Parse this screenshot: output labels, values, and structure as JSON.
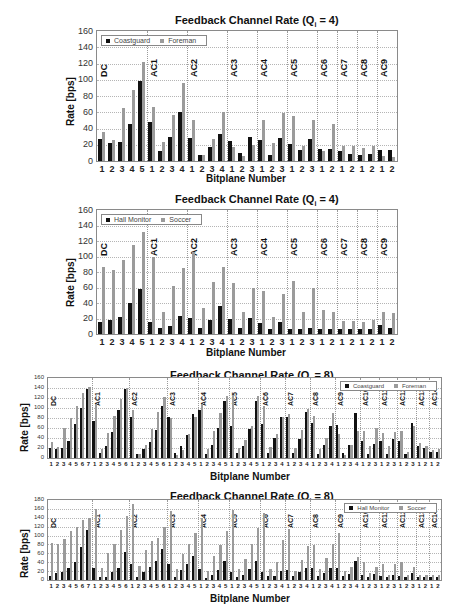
{
  "chart_data": [
    {
      "type": "bar",
      "title": "Feedback Channel Rate (Q_i = 4)",
      "title_main": "Feedback Channel Rate (Q",
      "title_sub": "i",
      "title_tail": " = 4)",
      "xlabel": "Bitplane Number",
      "ylabel": "Rate [bps]",
      "ylim": [
        0,
        160
      ],
      "yticks": [
        0,
        20,
        40,
        60,
        80,
        100,
        120,
        140,
        160
      ],
      "grid": true,
      "legend_position": "top-left",
      "legend": [
        "Coastguard",
        "Foreman"
      ],
      "groups": [
        {
          "label": "DC",
          "bitplanes": [
            1,
            2,
            3,
            4,
            5
          ]
        },
        {
          "label": "AC1",
          "bitplanes": [
            1,
            2,
            3,
            4
          ]
        },
        {
          "label": "AC2",
          "bitplanes": [
            1,
            2,
            3,
            4
          ]
        },
        {
          "label": "AC3",
          "bitplanes": [
            1,
            2,
            3
          ]
        },
        {
          "label": "AC4",
          "bitplanes": [
            1,
            2,
            3
          ]
        },
        {
          "label": "AC5",
          "bitplanes": [
            1,
            2,
            3
          ]
        },
        {
          "label": "AC6",
          "bitplanes": [
            1,
            2
          ]
        },
        {
          "label": "AC7",
          "bitplanes": [
            1,
            2
          ]
        },
        {
          "label": "AC8",
          "bitplanes": [
            1,
            2
          ]
        },
        {
          "label": "AC9",
          "bitplanes": [
            1,
            2
          ]
        }
      ],
      "categories": [
        "1",
        "2",
        "3",
        "4",
        "5",
        "1",
        "2",
        "3",
        "4",
        "1",
        "2",
        "3",
        "4",
        "1",
        "2",
        "3",
        "1",
        "2",
        "3",
        "1",
        "2",
        "3",
        "1",
        "2",
        "1",
        "2",
        "1",
        "2",
        "1",
        "2"
      ],
      "series": [
        {
          "name": "Coastguard",
          "color": "#111111",
          "values": [
            27,
            22,
            24,
            46,
            98,
            48,
            12,
            29,
            60,
            28,
            7,
            17,
            33,
            25,
            10,
            29,
            26,
            7,
            28,
            21,
            14,
            27,
            15,
            15,
            12,
            9,
            8,
            9,
            13,
            14
          ]
        },
        {
          "name": "Foreman",
          "color": "#9b9b9b",
          "values": [
            36,
            26,
            65,
            88,
            122,
            67,
            23,
            57,
            96,
            50,
            8,
            27,
            60,
            17,
            6,
            20,
            51,
            22,
            59,
            56,
            19,
            50,
            12,
            46,
            19,
            19,
            16,
            18,
            6,
            5
          ]
        }
      ]
    },
    {
      "type": "bar",
      "title": "Feedback Channel Rate (Q_i = 4)",
      "title_main": "Feedback Channel Rate (Q",
      "title_sub": "i",
      "title_tail": " = 4)",
      "xlabel": "Bitplane Number",
      "ylabel": "Rate [bps]",
      "ylim": [
        0,
        160
      ],
      "yticks": [
        0,
        20,
        40,
        60,
        80,
        100,
        120,
        140,
        160
      ],
      "grid": true,
      "legend_position": "top-left",
      "legend": [
        "Hall Monitor",
        "Soccer"
      ],
      "groups": [
        {
          "label": "DC",
          "bitplanes": [
            1,
            2,
            3,
            4,
            5
          ]
        },
        {
          "label": "AC1",
          "bitplanes": [
            1,
            2,
            3,
            4
          ]
        },
        {
          "label": "AC2",
          "bitplanes": [
            1,
            2,
            3,
            4
          ]
        },
        {
          "label": "AC3",
          "bitplanes": [
            1,
            2,
            3
          ]
        },
        {
          "label": "AC4",
          "bitplanes": [
            1,
            2,
            3
          ]
        },
        {
          "label": "AC5",
          "bitplanes": [
            1,
            2,
            3
          ]
        },
        {
          "label": "AC6",
          "bitplanes": [
            1,
            2
          ]
        },
        {
          "label": "AC7",
          "bitplanes": [
            1,
            2
          ]
        },
        {
          "label": "AC8",
          "bitplanes": [
            1,
            2
          ]
        },
        {
          "label": "AC9",
          "bitplanes": [
            1,
            2
          ]
        }
      ],
      "categories": [
        "1",
        "2",
        "3",
        "4",
        "5",
        "1",
        "2",
        "3",
        "4",
        "1",
        "2",
        "3",
        "4",
        "1",
        "2",
        "3",
        "1",
        "2",
        "3",
        "1",
        "2",
        "3",
        "1",
        "2",
        "1",
        "2",
        "1",
        "2",
        "1",
        "2"
      ],
      "series": [
        {
          "name": "Hall Monitor",
          "color": "#111111",
          "values": [
            15,
            18,
            22,
            40,
            58,
            15,
            8,
            10,
            23,
            21,
            8,
            18,
            36,
            20,
            8,
            21,
            14,
            7,
            15,
            7,
            7,
            8,
            7,
            7,
            6,
            6,
            6,
            6,
            11,
            8
          ]
        },
        {
          "name": "Soccer",
          "color": "#9b9b9b",
          "values": [
            86,
            82,
            95,
            115,
            132,
            99,
            28,
            62,
            85,
            106,
            34,
            67,
            86,
            66,
            29,
            60,
            56,
            22,
            51,
            68,
            29,
            60,
            31,
            28,
            17,
            17,
            15,
            18,
            28,
            27
          ]
        }
      ]
    },
    {
      "type": "bar",
      "title": "Feedback Channel Rate (Q_i = 8)",
      "title_main": "Feedback Channel Rate (Q",
      "title_sub": "i",
      "title_tail": " = 8)",
      "xlabel": "Bitplane Number",
      "ylabel": "Rate [bps]",
      "ylim": [
        0,
        160
      ],
      "yticks": [
        0,
        20,
        40,
        60,
        80,
        100,
        120,
        140,
        160
      ],
      "grid": true,
      "legend_position": "top-right",
      "legend": [
        "Coastguard",
        "Foreman"
      ],
      "groups": [
        {
          "label": "DC",
          "bitplanes": [
            1,
            2,
            3,
            4,
            5,
            6,
            7
          ]
        },
        {
          "label": "AC1",
          "bitplanes": [
            1,
            2,
            3,
            4,
            5,
            6
          ]
        },
        {
          "label": "AC2",
          "bitplanes": [
            1,
            2,
            3,
            4,
            5,
            6
          ]
        },
        {
          "label": "AC3",
          "bitplanes": [
            1,
            2,
            3,
            4,
            5
          ]
        },
        {
          "label": "AC4",
          "bitplanes": [
            1,
            2,
            3,
            4,
            5
          ]
        },
        {
          "label": "AC5",
          "bitplanes": [
            1,
            2,
            3,
            4,
            5
          ]
        },
        {
          "label": "AC6",
          "bitplanes": [
            1,
            2,
            3,
            4
          ]
        },
        {
          "label": "AC7",
          "bitplanes": [
            1,
            2,
            3,
            4
          ]
        },
        {
          "label": "AC8",
          "bitplanes": [
            1,
            2,
            3,
            4
          ]
        },
        {
          "label": "AC9",
          "bitplanes": [
            1,
            2,
            3,
            4
          ]
        },
        {
          "label": "AC10",
          "bitplanes": [
            1,
            2,
            3
          ]
        },
        {
          "label": "AC11",
          "bitplanes": [
            1,
            2,
            3
          ]
        },
        {
          "label": "AC12",
          "bitplanes": [
            1,
            2,
            3
          ]
        },
        {
          "label": "AC13",
          "bitplanes": [
            1,
            2
          ]
        },
        {
          "label": "AC14",
          "bitplanes": [
            1,
            2
          ]
        }
      ],
      "categories": [
        "1",
        "2",
        "3",
        "4",
        "5",
        "6",
        "7",
        "1",
        "2",
        "3",
        "4",
        "5",
        "6",
        "1",
        "2",
        "3",
        "4",
        "5",
        "6",
        "1",
        "2",
        "3",
        "4",
        "5",
        "1",
        "2",
        "3",
        "4",
        "5",
        "1",
        "2",
        "3",
        "4",
        "5",
        "1",
        "2",
        "3",
        "4",
        "1",
        "2",
        "3",
        "4",
        "1",
        "2",
        "3",
        "4",
        "1",
        "2",
        "3",
        "4",
        "1",
        "2",
        "3",
        "1",
        "2",
        "3",
        "1",
        "2",
        "3",
        "1",
        "2",
        "1",
        "2"
      ],
      "series": [
        {
          "name": "Coastguard",
          "color": "#111111",
          "values": [
            21,
            18,
            21,
            35,
            69,
            100,
            138,
            74,
            11,
            25,
            52,
            97,
            138,
            82,
            8,
            19,
            33,
            57,
            104,
            83,
            10,
            24,
            46,
            89,
            97,
            8,
            26,
            61,
            115,
            65,
            10,
            25,
            59,
            115,
            69,
            10,
            40,
            83,
            82,
            10,
            38,
            92,
            71,
            9,
            26,
            64,
            67,
            10,
            26,
            90,
            34,
            8,
            28,
            34,
            8,
            38,
            34,
            9,
            70,
            25,
            20,
            13,
            12
          ]
        },
        {
          "name": "Foreman",
          "color": "#9b9b9b",
          "values": [
            33,
            22,
            60,
            80,
            105,
            131,
            143,
            109,
            19,
            51,
            85,
            119,
            141,
            96,
            8,
            26,
            59,
            93,
            123,
            80,
            6,
            16,
            48,
            83,
            108,
            18,
            54,
            90,
            124,
            126,
            20,
            37,
            65,
            125,
            105,
            22,
            48,
            83,
            88,
            20,
            56,
            98,
            84,
            19,
            40,
            90,
            48,
            6,
            27,
            54,
            54,
            25,
            60,
            50,
            25,
            52,
            54,
            12,
            64,
            30,
            25,
            17,
            18
          ]
        }
      ]
    },
    {
      "type": "bar",
      "title": "Feedback Channel Rate (Q_i = 8)",
      "title_main": "Feedback Channel Rate (Q",
      "title_sub": "i",
      "title_tail": " = 8)",
      "xlabel": "Bitplane Number",
      "ylabel": "Rate [bps]",
      "ylim": [
        0,
        180
      ],
      "yticks": [
        0,
        20,
        40,
        60,
        80,
        100,
        120,
        140,
        160,
        180
      ],
      "grid": true,
      "legend_position": "top-right",
      "legend": [
        "Hall Monitor",
        "Soccer"
      ],
      "groups": [
        {
          "label": "DC",
          "bitplanes": [
            1,
            2,
            3,
            4,
            5,
            6,
            7
          ]
        },
        {
          "label": "AC1",
          "bitplanes": [
            1,
            2,
            3,
            4,
            5,
            6
          ]
        },
        {
          "label": "AC2",
          "bitplanes": [
            1,
            2,
            3,
            4,
            5,
            6
          ]
        },
        {
          "label": "AC3",
          "bitplanes": [
            1,
            2,
            3,
            4,
            5
          ]
        },
        {
          "label": "AC4",
          "bitplanes": [
            1,
            2,
            3,
            4,
            5
          ]
        },
        {
          "label": "AC5",
          "bitplanes": [
            1,
            2,
            3,
            4,
            5
          ]
        },
        {
          "label": "AC6",
          "bitplanes": [
            1,
            2,
            3,
            4
          ]
        },
        {
          "label": "AC7",
          "bitplanes": [
            1,
            2,
            3,
            4
          ]
        },
        {
          "label": "AC8",
          "bitplanes": [
            1,
            2,
            3,
            4
          ]
        },
        {
          "label": "AC9",
          "bitplanes": [
            1,
            2,
            3,
            4
          ]
        },
        {
          "label": "AC10",
          "bitplanes": [
            1,
            2,
            3
          ]
        },
        {
          "label": "AC11",
          "bitplanes": [
            1,
            2,
            3
          ]
        },
        {
          "label": "AC12",
          "bitplanes": [
            1,
            2,
            3
          ]
        },
        {
          "label": "AC13",
          "bitplanes": [
            1,
            2
          ]
        },
        {
          "label": "AC14",
          "bitplanes": [
            1,
            2
          ]
        }
      ],
      "categories": [
        "1",
        "2",
        "3",
        "4",
        "5",
        "6",
        "7",
        "1",
        "2",
        "3",
        "4",
        "5",
        "6",
        "1",
        "2",
        "3",
        "4",
        "5",
        "6",
        "1",
        "2",
        "3",
        "4",
        "5",
        "1",
        "2",
        "3",
        "4",
        "5",
        "1",
        "2",
        "3",
        "4",
        "5",
        "1",
        "2",
        "3",
        "4",
        "1",
        "2",
        "3",
        "4",
        "1",
        "2",
        "3",
        "4",
        "1",
        "2",
        "3",
        "4",
        "1",
        "2",
        "3",
        "1",
        "2",
        "3",
        "1",
        "2",
        "3",
        "1",
        "2",
        "1",
        "2"
      ],
      "series": [
        {
          "name": "Hall Monitor",
          "color": "#111111",
          "values": [
            10,
            16,
            17,
            28,
            40,
            74,
            112,
            26,
            7,
            7,
            17,
            28,
            62,
            35,
            7,
            17,
            30,
            42,
            70,
            37,
            6,
            22,
            35,
            55,
            24,
            5,
            12,
            22,
            42,
            18,
            6,
            12,
            24,
            42,
            18,
            8,
            10,
            20,
            22,
            8,
            17,
            26,
            27,
            8,
            16,
            28,
            28,
            8,
            14,
            42,
            12,
            7,
            14,
            8,
            7,
            12,
            8,
            6,
            16,
            7,
            7,
            7,
            7
          ]
        },
        {
          "name": "Soccer",
          "color": "#9b9b9b",
          "values": [
            83,
            80,
            93,
            110,
            120,
            135,
            140,
            160,
            27,
            60,
            82,
            112,
            145,
            172,
            32,
            68,
            88,
            95,
            120,
            155,
            25,
            58,
            80,
            105,
            140,
            20,
            55,
            78,
            110,
            158,
            25,
            48,
            80,
            118,
            150,
            25,
            40,
            90,
            115,
            20,
            45,
            76,
            78,
            25,
            50,
            80,
            105,
            20,
            30,
            52,
            40,
            15,
            30,
            35,
            12,
            35,
            40,
            12,
            30,
            12,
            12,
            12,
            12
          ]
        }
      ]
    }
  ],
  "panels": [
    {
      "title_main": "Feedback Channel Rate (Q",
      "title_sub": "i",
      "title_tail": " = 4)",
      "xlabel": "Bitplane Number",
      "ylabel": "Rate [bps]",
      "legend": [
        "Coastguard",
        "Foreman"
      ]
    },
    {
      "title_main": "Feedback Channel Rate (Q",
      "title_sub": "i",
      "title_tail": " = 4)",
      "xlabel": "Bitplane Number",
      "ylabel": "Rate [bps]",
      "legend": [
        "Hall Monitor",
        "Soccer"
      ]
    },
    {
      "title_main": "Feedback Channel Rate (Q",
      "title_sub": "i",
      "title_tail": " = 8)",
      "xlabel": "Bitplane Number",
      "ylabel": "Rate [bps]",
      "legend": [
        "Coastguard",
        "Foreman"
      ]
    },
    {
      "title_main": "Feedback Channel Rate (Q",
      "title_sub": "i",
      "title_tail": " = 8)",
      "xlabel": "Bitplane Number",
      "ylabel": "Rate [bps]",
      "legend": [
        "Hall Monitor",
        "Soccer"
      ]
    }
  ]
}
